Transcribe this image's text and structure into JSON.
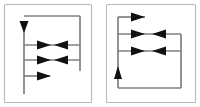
{
  "figure": {
    "canvas": {
      "width": 200,
      "height": 107
    },
    "background_color": "#ffffff",
    "line_color": "#808080",
    "arrow_color": "#111111",
    "frame_color": "#b9b9b9"
  },
  "panels": [
    {
      "id": "left-panel",
      "label": "Left panel",
      "frame": {
        "x": 4,
        "y": 4,
        "width": 88,
        "height": 99
      },
      "vertical_lines": [
        {
          "name": "left-rail",
          "x": 24,
          "y1": 22,
          "y2": 94
        },
        {
          "name": "right-rail",
          "x": 80,
          "y1": 16,
          "y2": 71
        }
      ],
      "horizontal_lines": [
        {
          "name": "top-connector",
          "y": 16,
          "x1": 24,
          "x2": 80
        },
        {
          "name": "row-1",
          "y": 45,
          "x1": 24,
          "x2": 80
        },
        {
          "name": "row-2",
          "y": 60,
          "x1": 24,
          "x2": 80
        },
        {
          "name": "row-3",
          "y": 76,
          "x1": 24,
          "x2": 50
        }
      ],
      "arrows": [
        {
          "name": "down-arrow",
          "direction": "down",
          "x": 24,
          "y": 30
        },
        {
          "name": "row-1-right-arrow",
          "direction": "right",
          "x": 44,
          "y": 45
        },
        {
          "name": "row-1-left-arrow",
          "direction": "left",
          "x": 62,
          "y": 45
        },
        {
          "name": "row-2-right-arrow",
          "direction": "right",
          "x": 44,
          "y": 60
        },
        {
          "name": "row-2-left-arrow",
          "direction": "left",
          "x": 62,
          "y": 60
        },
        {
          "name": "row-3-right-arrow",
          "direction": "right",
          "x": 44,
          "y": 76
        }
      ]
    },
    {
      "id": "right-panel",
      "label": "Right panel",
      "frame": {
        "x": 106,
        "y": 4,
        "width": 90,
        "height": 99
      },
      "vertical_lines": [
        {
          "name": "left-rail",
          "x": 118,
          "y1": 17,
          "y2": 88
        },
        {
          "name": "right-rail",
          "x": 181,
          "y1": 34,
          "y2": 88
        }
      ],
      "horizontal_lines": [
        {
          "name": "row-1",
          "y": 17,
          "x1": 118,
          "x2": 145
        },
        {
          "name": "row-2",
          "y": 34,
          "x1": 118,
          "x2": 181
        },
        {
          "name": "row-3",
          "y": 51,
          "x1": 118,
          "x2": 181
        },
        {
          "name": "bottom-connector",
          "y": 88,
          "x1": 118,
          "x2": 181
        }
      ],
      "arrows": [
        {
          "name": "row-1-right-arrow",
          "direction": "right",
          "x": 138,
          "y": 17
        },
        {
          "name": "row-2-right-arrow",
          "direction": "right",
          "x": 138,
          "y": 34
        },
        {
          "name": "row-2-left-arrow",
          "direction": "left",
          "x": 160,
          "y": 34
        },
        {
          "name": "row-3-right-arrow",
          "direction": "right",
          "x": 138,
          "y": 51
        },
        {
          "name": "row-3-left-arrow",
          "direction": "left",
          "x": 160,
          "y": 51
        },
        {
          "name": "up-arrow",
          "direction": "up",
          "x": 118,
          "y": 72
        }
      ]
    }
  ]
}
